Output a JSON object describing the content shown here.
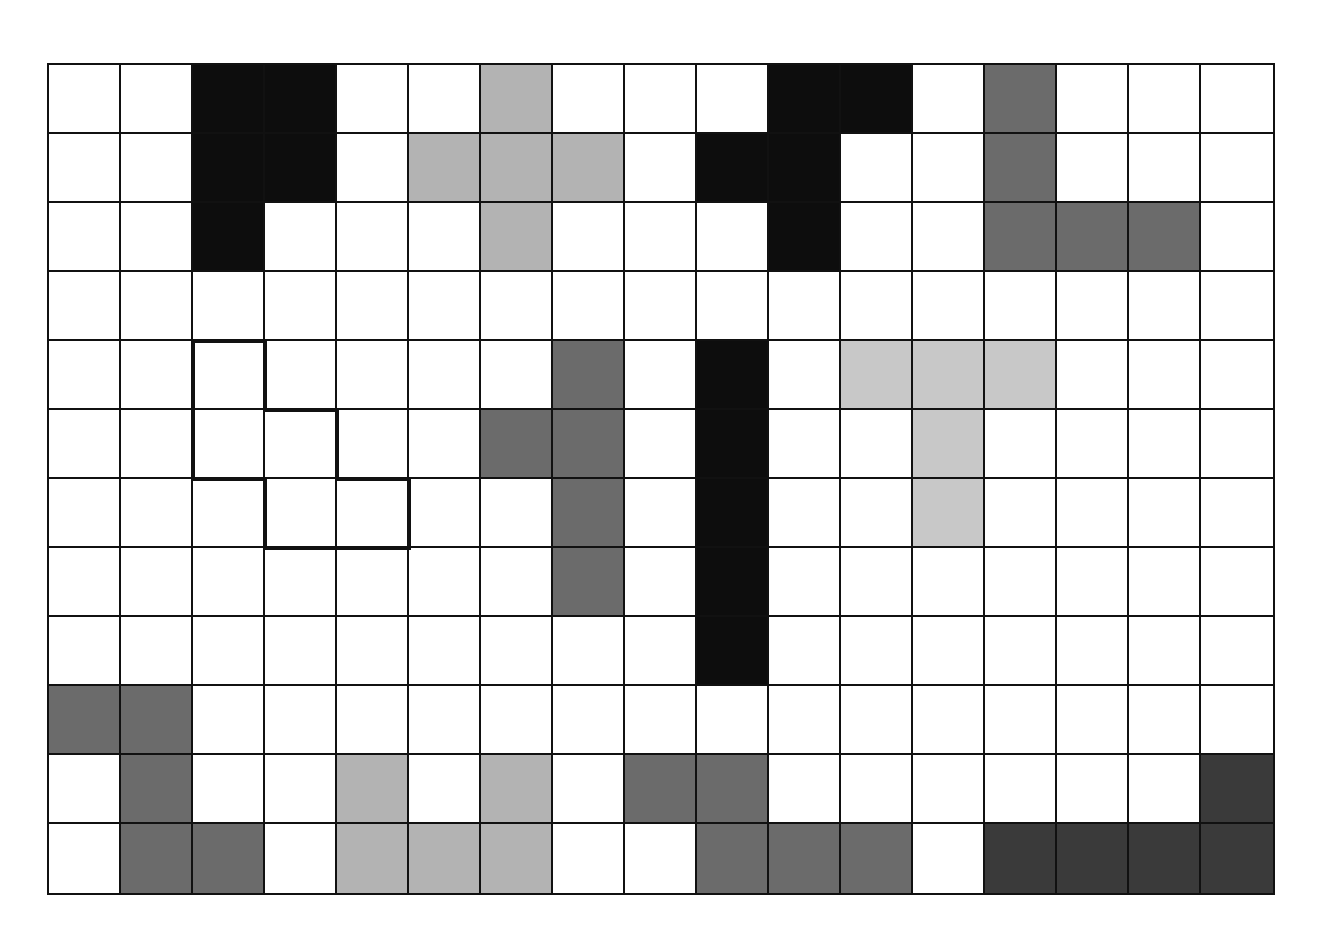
{
  "puzzle": {
    "rows": 12,
    "cols": 17,
    "colors": {
      "empty": "#ffffff",
      "black": "#0d0d0d",
      "dark": "#3a3a3a",
      "mid": "#6b6b6b",
      "light": "#b3b3b3",
      "lighter": "#c8c8c8",
      "grid_line": "#111111",
      "outline": "#111111"
    },
    "pieces": [
      {
        "name": "P-pentomino",
        "color": "black",
        "cells": [
          [
            0,
            2
          ],
          [
            0,
            3
          ],
          [
            1,
            2
          ],
          [
            1,
            3
          ],
          [
            2,
            2
          ]
        ]
      },
      {
        "name": "X-pentomino",
        "color": "light",
        "cells": [
          [
            0,
            6
          ],
          [
            1,
            5
          ],
          [
            1,
            6
          ],
          [
            1,
            7
          ],
          [
            2,
            6
          ]
        ]
      },
      {
        "name": "F-pentomino",
        "color": "black",
        "cells": [
          [
            0,
            10
          ],
          [
            0,
            11
          ],
          [
            1,
            9
          ],
          [
            1,
            10
          ],
          [
            2,
            10
          ]
        ]
      },
      {
        "name": "V-pentomino",
        "color": "mid",
        "cells": [
          [
            0,
            13
          ],
          [
            1,
            13
          ],
          [
            2,
            13
          ],
          [
            2,
            14
          ],
          [
            2,
            15
          ]
        ]
      },
      {
        "name": "Y-pentomino",
        "color": "mid",
        "cells": [
          [
            4,
            7
          ],
          [
            5,
            6
          ],
          [
            5,
            7
          ],
          [
            6,
            7
          ],
          [
            7,
            7
          ]
        ]
      },
      {
        "name": "I-pentomino",
        "color": "black",
        "cells": [
          [
            4,
            9
          ],
          [
            5,
            9
          ],
          [
            6,
            9
          ],
          [
            7,
            9
          ],
          [
            8,
            9
          ]
        ]
      },
      {
        "name": "T-pentomino",
        "color": "lighter",
        "cells": [
          [
            4,
            11
          ],
          [
            4,
            12
          ],
          [
            4,
            13
          ],
          [
            5,
            12
          ],
          [
            6,
            12
          ]
        ]
      },
      {
        "name": "W-pentomino",
        "color": "mid",
        "cells": [
          [
            9,
            0
          ],
          [
            9,
            1
          ],
          [
            10,
            1
          ],
          [
            11,
            1
          ],
          [
            11,
            2
          ]
        ]
      },
      {
        "name": "U-pentomino",
        "color": "light",
        "cells": [
          [
            10,
            4
          ],
          [
            10,
            6
          ],
          [
            11,
            4
          ],
          [
            11,
            5
          ],
          [
            11,
            6
          ]
        ]
      },
      {
        "name": "N-pentomino",
        "color": "mid",
        "cells": [
          [
            10,
            8
          ],
          [
            10,
            9
          ],
          [
            11,
            9
          ],
          [
            11,
            10
          ],
          [
            11,
            11
          ]
        ]
      },
      {
        "name": "L-pentomino",
        "color": "dark",
        "cells": [
          [
            10,
            16
          ],
          [
            11,
            13
          ],
          [
            11,
            14
          ],
          [
            11,
            15
          ],
          [
            11,
            16
          ]
        ]
      }
    ],
    "outlined_piece": {
      "name": "W-shape outline (unfilled)",
      "cells": [
        [
          4,
          2
        ],
        [
          5,
          2
        ],
        [
          5,
          3
        ],
        [
          6,
          3
        ],
        [
          6,
          4
        ]
      ]
    }
  }
}
